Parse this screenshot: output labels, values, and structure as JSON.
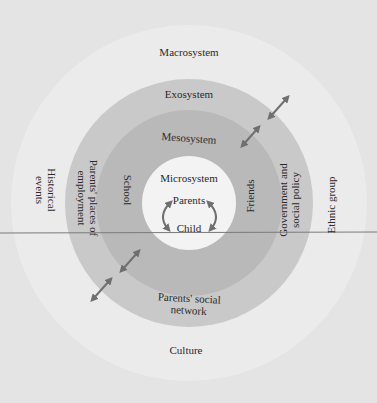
{
  "diagram": {
    "colors": {
      "background": "#e4e4e4",
      "macrosystem": "#ececec",
      "exosystem": "#c9c9c9",
      "mesosystem": "#bababa",
      "microsystem": "#f3f3f3",
      "arrow": "#6f6f6f",
      "text": "#2a2a2a",
      "rule_line": "#7a7a7a"
    },
    "layers": [
      {
        "name": "Macrosystem",
        "elements": [
          "Historical events",
          "Ethnic group",
          "Culture"
        ]
      },
      {
        "name": "Exosystem",
        "elements": [
          "Parents' places of employment",
          "Government and social policy",
          "Parents' social network"
        ]
      },
      {
        "name": "Mesosystem",
        "elements": [
          "School",
          "Friends"
        ]
      },
      {
        "name": "Microsystem",
        "elements": [
          "Parents",
          "Child"
        ]
      }
    ],
    "labels": {
      "macrosystem": "Macrosystem",
      "exosystem": "Exosystem",
      "mesosystem": "Mesosystem",
      "microsystem": "Microsystem",
      "parents": "Parents",
      "child": "Child",
      "school": "School",
      "friends": "Friends",
      "parents_employment": "Parents' places of\nemployment",
      "government_policy": "Government and\nsocial policy",
      "parents_social_network": "Parents' social\nnetwork",
      "historical_events": "Historical\nevents",
      "ethnic_group": "Ethnic group",
      "culture": "Culture"
    },
    "arrows": [
      {
        "name": "bidirectional-arrow-upper-right-outer",
        "from": "exosystem",
        "to": "macrosystem"
      },
      {
        "name": "bidirectional-arrow-upper-right-inner",
        "from": "mesosystem",
        "to": "exosystem"
      },
      {
        "name": "bidirectional-arrow-lower-left-inner",
        "from": "mesosystem",
        "to": "exosystem"
      },
      {
        "name": "bidirectional-arrow-lower-left-outer",
        "from": "exosystem",
        "to": "macrosystem"
      },
      {
        "name": "parents-child-cycle-arrows",
        "from": "parents",
        "to": "child"
      }
    ]
  }
}
